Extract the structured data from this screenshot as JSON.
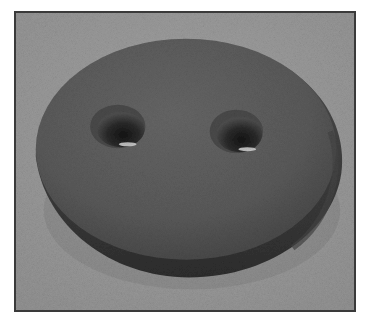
{
  "image": {
    "subject": "Two-hole button rendered in 3D",
    "alt_text": "Grayscale 3D render of a round two-hole button resting on a textured gray surface",
    "hole_count": 2
  },
  "colors": {
    "background": "#9a9a9a",
    "button_top": "#5c5c5c",
    "button_edge": "#3c3c3c",
    "frame_border": "#3a3a3a",
    "hole_shadow": "#1c1c1c",
    "hole_highlight": "#d8d8d8"
  }
}
